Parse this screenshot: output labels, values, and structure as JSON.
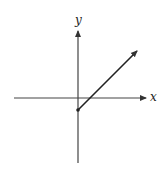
{
  "diagram": {
    "type": "coordinate-plane",
    "x_axis": {
      "label": "x",
      "from": [
        14,
        98
      ],
      "to": [
        146,
        98
      ]
    },
    "y_axis": {
      "label": "y",
      "from": [
        78,
        163
      ],
      "to": [
        78,
        30
      ]
    },
    "ray": {
      "start": [
        78,
        110
      ],
      "end": [
        138,
        50
      ],
      "start_marker": "filled-dot",
      "end_marker": "arrow"
    },
    "colors": {
      "stroke": "#333333",
      "background": "#ffffff"
    }
  }
}
